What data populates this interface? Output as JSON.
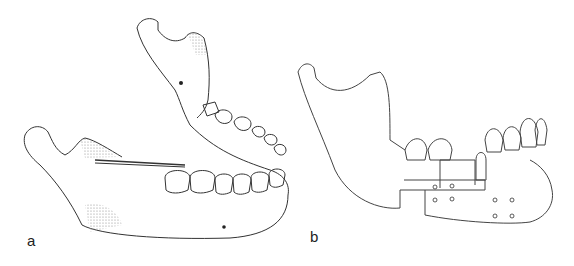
{
  "figure": {
    "panels": [
      {
        "id": "a",
        "label": "a",
        "description": "Mandible oblique view with needle/probe inserted near coronoid notch; stippled shaded regions at coronoid process and angle"
      },
      {
        "id": "b",
        "label": "b",
        "description": "Mandible lateral view with step osteotomy segment fixed by wires/screws; bone graft block"
      }
    ]
  },
  "colors": {
    "line": "#333333",
    "stipple": "#9a9a9a",
    "background": "#ffffff"
  }
}
